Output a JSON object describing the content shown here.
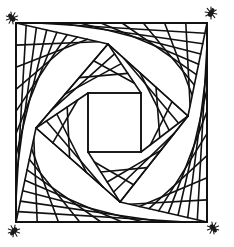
{
  "artwork": {
    "title": "Twisted squares line art",
    "description": "Black line-art drawing of an outer square filled with curving fan lines spiraling in to a small inner square, with a small spider glyph at each outer corner",
    "colors": {
      "ink": "#111111",
      "background": "#ffffff"
    },
    "fan_lines_per_quadrant": 9,
    "corner_decorations": [
      {
        "position": "top-left",
        "icon": "spider-icon"
      },
      {
        "position": "top-right",
        "icon": "spider-icon"
      },
      {
        "position": "bottom-left",
        "icon": "spider-icon"
      },
      {
        "position": "bottom-right",
        "icon": "spider-icon"
      }
    ]
  }
}
